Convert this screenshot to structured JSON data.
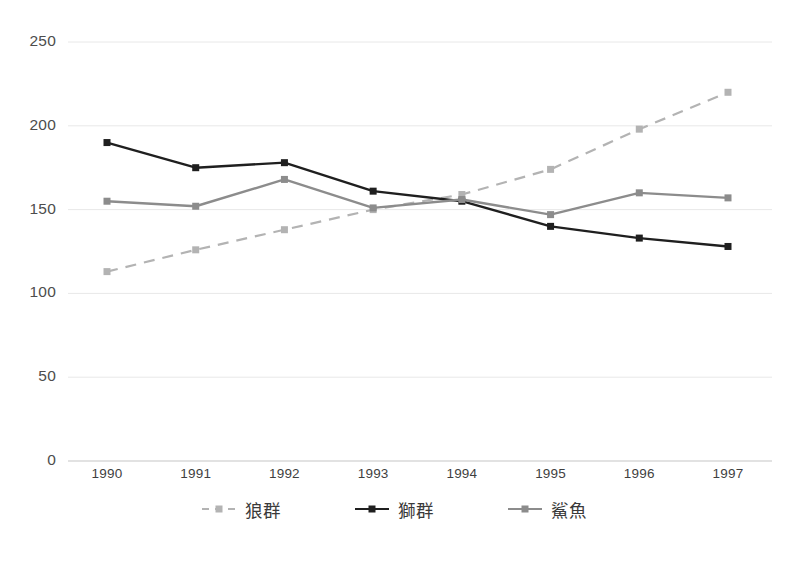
{
  "chart_data": {
    "type": "line",
    "title": "",
    "subtitle": "",
    "xlabel": "",
    "ylabel": "",
    "categories": [
      "1990",
      "1991",
      "1992",
      "1993",
      "1994",
      "1995",
      "1996",
      "1997"
    ],
    "x": [
      1990,
      1991,
      1992,
      1993,
      1994,
      1995,
      1996,
      1997
    ],
    "ylim": [
      0,
      250
    ],
    "yticks": [
      0,
      50,
      100,
      150,
      200,
      250
    ],
    "ytick_labels": [
      "0",
      "50",
      "100",
      "150",
      "200",
      "250"
    ],
    "grid": true,
    "grid_axis": "y",
    "legend_position": "bottom",
    "series": [
      {
        "name": "狼群",
        "values": [
          113,
          126,
          138,
          150,
          159,
          174,
          198,
          220
        ],
        "color": "#b3b3b3",
        "line_style": "dashed",
        "marker": "square"
      },
      {
        "name": "獅群",
        "values": [
          190,
          175,
          178,
          161,
          155,
          140,
          133,
          128
        ],
        "color": "#1f1f1f",
        "line_style": "solid",
        "marker": "square"
      },
      {
        "name": "鯊魚",
        "values": [
          155,
          152,
          168,
          151,
          156,
          147,
          160,
          157
        ],
        "color": "#8c8c8c",
        "line_style": "solid",
        "marker": "square"
      }
    ]
  },
  "axis": {
    "y_labels": [
      "250",
      "200",
      "150",
      "100",
      "50",
      "0"
    ],
    "x_labels": [
      "1990",
      "1991",
      "1992",
      "1993",
      "1994",
      "1995",
      "1996",
      "1997"
    ]
  },
  "legend": {
    "items": [
      {
        "label": "狼群",
        "color": "#b3b3b3",
        "style": "dashed"
      },
      {
        "label": "獅群",
        "color": "#1f1f1f",
        "style": "solid"
      },
      {
        "label": "鯊魚",
        "color": "#8c8c8c",
        "style": "solid"
      }
    ]
  },
  "colors": {
    "background": "#ffffff",
    "grid": "#e8e8e8",
    "axis_line": "#d8d8d8",
    "tick_text": "#4d4d4d",
    "wolf": "#b3b3b3",
    "lion": "#1f1f1f",
    "shark": "#8c8c8c"
  }
}
